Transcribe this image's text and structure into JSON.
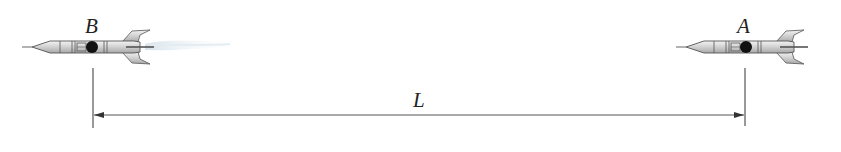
{
  "diagram": {
    "rocket_b": {
      "label": "B",
      "has_exhaust": true,
      "x": 92
    },
    "rocket_a": {
      "label": "A",
      "has_exhaust": false,
      "x": 744
    },
    "distance": {
      "label": "L",
      "from": "B",
      "to": "A"
    }
  },
  "colors": {
    "line": "#555555",
    "rocket_body": "#d8d8d8",
    "rocket_outline": "#555555",
    "window": "#111111",
    "exhaust": "#c9d8e3"
  }
}
